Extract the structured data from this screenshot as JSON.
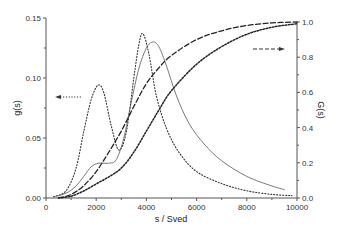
{
  "chart_data": {
    "type": "line",
    "title": "",
    "xlabel": "s / Sved",
    "ylabel": "g(s)",
    "ylabel_right": "G(s)",
    "xlim": [
      0,
      10000
    ],
    "ylim": [
      0,
      0.15
    ],
    "ylim_right": [
      0,
      1.0
    ],
    "grid": false,
    "legend": "none",
    "x_ticks": [
      "0",
      "2000",
      "4000",
      "6000",
      "8000",
      "10000"
    ],
    "y_ticks": [
      "0.00",
      "0.05",
      "0.10",
      "0.15"
    ],
    "y_ticks_right": [
      "0.0",
      "0.2",
      "0.4",
      "0.6",
      "0.8",
      "1.0"
    ],
    "annotations": [
      {
        "type": "arrow",
        "direction": "left",
        "style": "dotted",
        "meaning": "dotted curves read on left axis g(s)"
      },
      {
        "type": "arrow",
        "direction": "right",
        "style": "dash-dot",
        "meaning": "cumulative curves read on right axis G(s)"
      }
    ],
    "series": [
      {
        "name": "g(s) bimodal (dotted)",
        "axis": "left",
        "style": "dotted",
        "x": [
          300,
          800,
          1200,
          1500,
          1800,
          2070,
          2300,
          2600,
          2900,
          3200,
          3500,
          3700,
          3860,
          4100,
          4400,
          4800,
          5300,
          6000,
          7000,
          8000,
          9000,
          9800
        ],
        "values": [
          0.001,
          0.006,
          0.025,
          0.055,
          0.082,
          0.094,
          0.088,
          0.06,
          0.04,
          0.055,
          0.1,
          0.128,
          0.137,
          0.12,
          0.085,
          0.058,
          0.038,
          0.022,
          0.012,
          0.006,
          0.003,
          0.002
        ]
      },
      {
        "name": "g(s) with shoulder (solid)",
        "axis": "left",
        "style": "solid",
        "x": [
          300,
          800,
          1200,
          1500,
          1800,
          2100,
          2500,
          2800,
          3100,
          3400,
          3700,
          4000,
          4260,
          4500,
          4800,
          5200,
          5700,
          6300,
          7000,
          8000,
          9000,
          9500
        ],
        "values": [
          0.001,
          0.004,
          0.01,
          0.018,
          0.026,
          0.029,
          0.029,
          0.032,
          0.05,
          0.08,
          0.108,
          0.125,
          0.13,
          0.126,
          0.11,
          0.085,
          0.062,
          0.045,
          0.031,
          0.018,
          0.01,
          0.007
        ]
      },
      {
        "name": "G(s) cumulative (long dash)",
        "axis": "right",
        "style": "dashed",
        "x": [
          500,
          1000,
          1500,
          2000,
          2500,
          3000,
          3500,
          4000,
          4500,
          5000,
          6000,
          7000,
          8000,
          9000,
          10000
        ],
        "values": [
          0.0,
          0.02,
          0.07,
          0.15,
          0.26,
          0.38,
          0.52,
          0.65,
          0.74,
          0.81,
          0.9,
          0.95,
          0.98,
          0.995,
          1.0
        ]
      },
      {
        "name": "G(s) cumulative (short dash)",
        "axis": "right",
        "style": "dash-dot",
        "x": [
          500,
          1000,
          1500,
          2000,
          2500,
          3000,
          3500,
          4000,
          4500,
          5000,
          6000,
          7000,
          8000,
          9000,
          10000
        ],
        "values": [
          0.0,
          0.01,
          0.04,
          0.08,
          0.12,
          0.17,
          0.26,
          0.38,
          0.5,
          0.61,
          0.76,
          0.86,
          0.93,
          0.97,
          0.99
        ]
      }
    ]
  }
}
